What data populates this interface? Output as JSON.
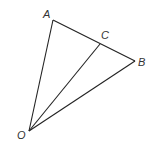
{
  "diagram": {
    "type": "geometry",
    "points": {
      "A": {
        "label": "A",
        "x": 53,
        "y": 20,
        "lx": 43,
        "ly": 18
      },
      "B": {
        "label": "B",
        "x": 135,
        "y": 61,
        "lx": 138,
        "ly": 66
      },
      "C": {
        "label": "C",
        "x": 100,
        "y": 44,
        "lx": 101,
        "ly": 39
      },
      "O": {
        "label": "O",
        "x": 29,
        "y": 131,
        "lx": 17,
        "ly": 139
      }
    },
    "segments": [
      [
        "O",
        "A"
      ],
      [
        "O",
        "B"
      ],
      [
        "O",
        "C"
      ],
      [
        "A",
        "B"
      ]
    ],
    "colors": {
      "line": "#222222",
      "label": "#333333"
    }
  }
}
